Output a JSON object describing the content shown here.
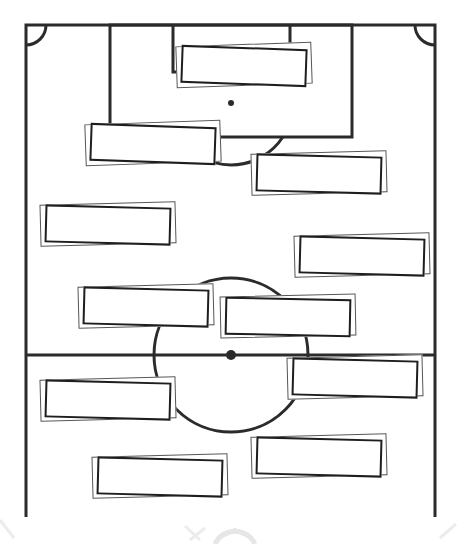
{
  "diagram": {
    "type": "football-pitch-lineup",
    "colors": {
      "line": "#2b2b2b",
      "card_border": "#1e1e1e",
      "card_shadow": "#555555",
      "background": "#ffffff",
      "watermark": "#e6e6e6"
    },
    "pitch": {
      "left": 26,
      "right": 435,
      "top": 25,
      "bottom": 517,
      "penalty_box": {
        "x1": 110,
        "x2": 352,
        "y2": 137
      },
      "goal_area": {
        "x1": 173,
        "x2": 290,
        "y2": 72
      },
      "penalty_spot": {
        "x": 231,
        "y": 103
      },
      "halfway_y": 355,
      "center": {
        "x": 231,
        "y": 355,
        "radius": 77
      },
      "corner_radius": 20
    },
    "cards": [
      {
        "id": "card-1",
        "x": 181,
        "y": 47,
        "w": 126,
        "h": 38,
        "rot": 2.0,
        "label": ""
      },
      {
        "id": "card-2",
        "x": 90,
        "y": 125,
        "w": 126,
        "h": 38,
        "rot": 2.0,
        "label": ""
      },
      {
        "id": "card-3",
        "x": 256,
        "y": 155,
        "w": 126,
        "h": 38,
        "rot": 1.5,
        "label": ""
      },
      {
        "id": "card-4",
        "x": 45,
        "y": 206,
        "w": 126,
        "h": 38,
        "rot": 1.5,
        "label": ""
      },
      {
        "id": "card-5",
        "x": 299,
        "y": 237,
        "w": 126,
        "h": 38,
        "rot": 1.5,
        "label": ""
      },
      {
        "id": "card-6",
        "x": 83,
        "y": 288,
        "w": 126,
        "h": 38,
        "rot": 1.5,
        "label": ""
      },
      {
        "id": "card-7",
        "x": 225,
        "y": 298,
        "w": 126,
        "h": 38,
        "rot": 1.2,
        "label": ""
      },
      {
        "id": "card-8",
        "x": 292,
        "y": 359,
        "w": 126,
        "h": 38,
        "rot": 1.5,
        "label": ""
      },
      {
        "id": "card-9",
        "x": 45,
        "y": 381,
        "w": 126,
        "h": 38,
        "rot": 1.5,
        "label": ""
      },
      {
        "id": "card-10",
        "x": 256,
        "y": 438,
        "w": 126,
        "h": 38,
        "rot": 1.5,
        "label": ""
      },
      {
        "id": "card-11",
        "x": 97,
        "y": 458,
        "w": 126,
        "h": 38,
        "rot": 1.5,
        "label": ""
      }
    ]
  }
}
